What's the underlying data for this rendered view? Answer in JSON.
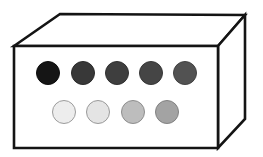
{
  "canvas": {
    "width": 263,
    "height": 157,
    "background": "#ffffff",
    "title": "Open-top rectangular box containing two rows of grayscale discs"
  },
  "box": {
    "name": "rectangular-box",
    "line_color": "#141414",
    "line_width": 2.6,
    "front_face": {
      "fill": "#ffffff",
      "points": "14,46 218,46 218,148 14,148"
    },
    "top_face": {
      "fill": "#ffffff",
      "points": "14,46 60,14 245,15 218,46"
    },
    "right_face": {
      "fill": "#ffffff",
      "points": "218,46 245,15 245,119 218,148"
    },
    "vertices": {
      "front_top_left": [
        14,
        46
      ],
      "front_top_right": [
        218,
        46
      ],
      "front_bottom_right": [
        218,
        148
      ],
      "front_bottom_left": [
        14,
        148
      ],
      "back_top_left": [
        60,
        14
      ],
      "back_top_right": [
        245,
        15
      ],
      "back_bottom_right": [
        245,
        119
      ]
    }
  },
  "discs": {
    "top_row": {
      "name": "dark-disc-row",
      "count": 5,
      "center_y": 73,
      "radius": 11.5,
      "items": [
        {
          "label": "disc-dark-1",
          "cx": 48,
          "fill": "#151515",
          "stroke": "#0d0d0d"
        },
        {
          "label": "disc-dark-2",
          "cx": 83,
          "fill": "#383838",
          "stroke": "#2a2a2a"
        },
        {
          "label": "disc-dark-3",
          "cx": 117,
          "fill": "#3e3e3e",
          "stroke": "#303030"
        },
        {
          "label": "disc-dark-4",
          "cx": 151,
          "fill": "#454545",
          "stroke": "#373737"
        },
        {
          "label": "disc-dark-5",
          "cx": 185,
          "fill": "#525252",
          "stroke": "#424242"
        }
      ]
    },
    "bottom_row": {
      "name": "light-disc-row",
      "count": 4,
      "center_y": 112,
      "radius": 11.5,
      "items": [
        {
          "label": "disc-light-1",
          "cx": 64,
          "fill": "#ededed",
          "stroke": "#9c9c9c"
        },
        {
          "label": "disc-light-2",
          "cx": 98,
          "fill": "#e4e4e4",
          "stroke": "#9a9a9a"
        },
        {
          "label": "disc-light-3",
          "cx": 133,
          "fill": "#bdbdbd",
          "stroke": "#8e8e8e"
        },
        {
          "label": "disc-light-4",
          "cx": 167,
          "fill": "#a3a3a3",
          "stroke": "#828282"
        }
      ]
    }
  }
}
